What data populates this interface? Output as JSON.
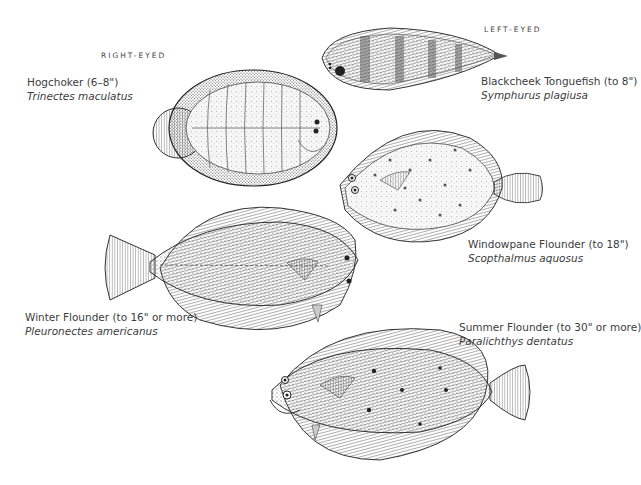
{
  "headings": {
    "right_eyed": "RIGHT-EYED",
    "left_eyed": "LEFT-EYED"
  },
  "fish": [
    {
      "id": "hogchoker",
      "group": "right_eyed",
      "common": "Hogchoker (6–8\")",
      "scientific": "Trinectes maculatus"
    },
    {
      "id": "blackcheek-tonguefish",
      "group": "left_eyed",
      "common": "Blackcheek Tonguefish (to 8\")",
      "scientific": "Symphurus plagiusa"
    },
    {
      "id": "windowpane-flounder",
      "group": "left_eyed",
      "common": "Windowpane Flounder (to 18\")",
      "scientific": "Scopthalmus aquosus"
    },
    {
      "id": "winter-flounder",
      "group": "right_eyed",
      "common": "Winter Flounder (to 16\" or more)",
      "scientific": "Pleuronectes americanus"
    },
    {
      "id": "summer-flounder",
      "group": "left_eyed",
      "common": "Summer Flounder (to 30\" or more)",
      "scientific": "Paralichthys dentatus"
    }
  ],
  "colors": {
    "background": "#ffffff",
    "ink": "#2a2a2a",
    "text": "#3c3c3c"
  }
}
